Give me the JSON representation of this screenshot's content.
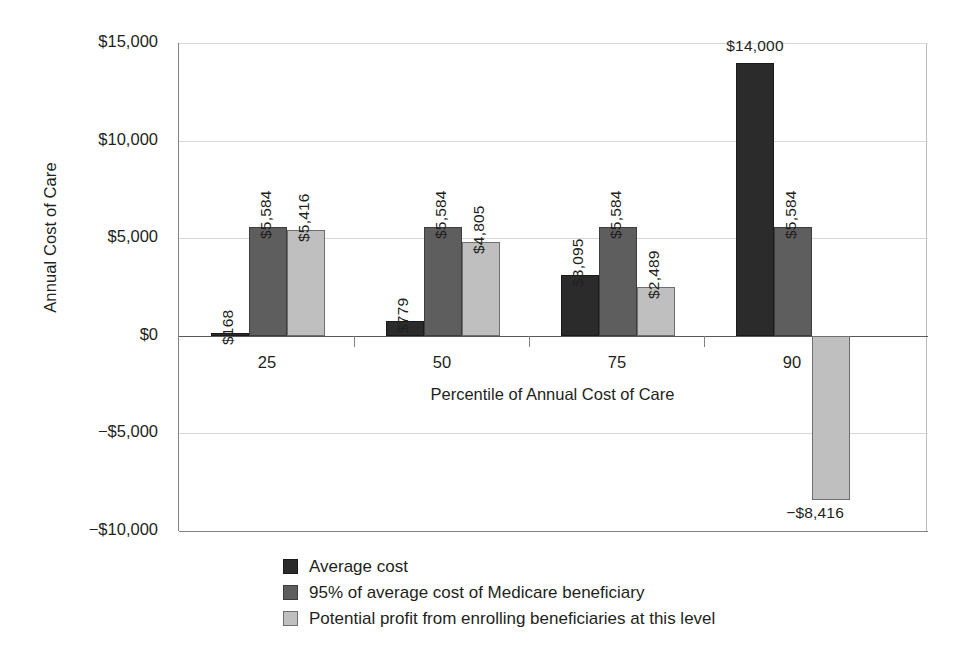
{
  "chart_data": {
    "type": "bar",
    "title": "",
    "xlabel": "Percentile of Annual Cost of Care",
    "ylabel": "Annual Cost of Care",
    "categories": [
      "25",
      "50",
      "75",
      "90"
    ],
    "series": [
      {
        "name": "Average cost",
        "color": "#2b2b2b",
        "values": [
          168,
          779,
          3095,
          14000
        ],
        "labels": [
          "$168",
          "$779",
          "$3,095",
          "$14,000"
        ]
      },
      {
        "name": "95% of average cost of Medicare beneficiary",
        "color": "#5e5e5e",
        "values": [
          5584,
          5584,
          5584,
          5584
        ],
        "labels": [
          "$5,584",
          "$5,584",
          "$5,584",
          "$5,584"
        ]
      },
      {
        "name": "Potential profit from enrolling beneficiaries at this level",
        "color": "#bfbfbf",
        "values": [
          5416,
          4805,
          2489,
          -8416
        ],
        "labels": [
          "$5,416",
          "$4,805",
          "$2,489",
          "−$8,416"
        ]
      }
    ],
    "ylim": [
      -10000,
      15000
    ],
    "yticks": [
      15000,
      10000,
      5000,
      0,
      -5000,
      -10000
    ],
    "ytick_labels": [
      "$15,000",
      "$10,000",
      "$5,000",
      "$0",
      "−$5,000",
      "−$10,000"
    ],
    "grid": true,
    "legend_position": "bottom-center"
  },
  "axes": {
    "y_title": "Annual Cost of Care",
    "x_title": "Percentile of Annual Cost of Care",
    "y_ticks": [
      {
        "label": "$15,000",
        "value": 15000
      },
      {
        "label": "$10,000",
        "value": 10000
      },
      {
        "label": "$5,000",
        "value": 5000
      },
      {
        "label": "$0",
        "value": 0
      },
      {
        "label": "−$5,000",
        "value": -5000
      },
      {
        "label": "−$10,000",
        "value": -10000
      }
    ],
    "x_ticks": [
      {
        "label": "25"
      },
      {
        "label": "50"
      },
      {
        "label": "75"
      },
      {
        "label": "90"
      }
    ]
  },
  "legend": {
    "items": [
      {
        "label": "Average cost",
        "swatch": "series-0"
      },
      {
        "label": "95% of average cost of Medicare beneficiary",
        "swatch": "series-1"
      },
      {
        "label": "Potential profit from enrolling beneficiaries at this level",
        "swatch": "series-2"
      }
    ]
  }
}
